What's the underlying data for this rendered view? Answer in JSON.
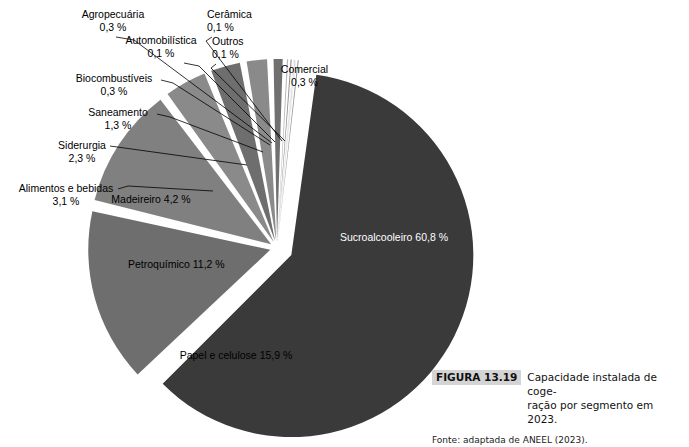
{
  "chart_data": {
    "type": "pie",
    "unit": "%",
    "legend_position": "callout-labels",
    "exploded": true,
    "categories": [
      "Sucroalcooleiro",
      "Papel e celulose",
      "Petroquímico",
      "Madeireiro",
      "Alimentos e bebidas",
      "Siderurgia",
      "Saneamento",
      "Biocombustíveis",
      "Agropecuária",
      "Automobilística",
      "Cerâmica",
      "Outros",
      "Comercial"
    ],
    "values": [
      60.8,
      15.9,
      11.2,
      4.2,
      3.1,
      2.3,
      1.3,
      0.3,
      0.3,
      0.1,
      0.1,
      0.1,
      0.3
    ],
    "value_labels": [
      "60,8 %",
      "15,9 %",
      "11,2 %",
      "4,2 %",
      "3,1 %",
      "2,3 %",
      "1,3 %",
      "0,3 %",
      "0,3 %",
      "0,1 %",
      "0,1 %",
      "0,1 %",
      "0,3 %"
    ],
    "slice_colors": [
      "#3a3a3a",
      "#6e6e6e",
      "#808080",
      "#8a8a8a",
      "#6e6e6e",
      "#8a8a8a",
      "#707070",
      "#b5b5b5",
      "#8f8f8f",
      "#cfcfcf",
      "#a8a8a8",
      "#d8d8d8",
      "#9a9a9a"
    ]
  },
  "slices": {
    "sucroalcooleiro": {
      "label": "Sucroalcooleiro",
      "value": "60,8 %"
    },
    "papel_e_celulose": {
      "label": "Papel e celulose",
      "value": "15,9 %"
    },
    "petroquimico": {
      "label": "Petroquímico",
      "value": "11,2 %"
    },
    "madeireiro": {
      "label": "Madeireiro",
      "value": "4,2 %"
    },
    "alimentos_e_bebidas": {
      "label": "Alimentos e bebidas",
      "value": "3,1 %"
    },
    "siderurgia": {
      "label": "Siderurgia",
      "value": "2,3 %"
    },
    "saneamento": {
      "label": "Saneamento",
      "value": "1,3 %"
    },
    "biocombustiveis": {
      "label": "Biocombustíveis",
      "value": "0,3 %"
    },
    "agropecuaria": {
      "label": "Agropecuária",
      "value": "0,3 %"
    },
    "automobilistica": {
      "label": "Automobilística",
      "value": "0,1 %"
    },
    "ceramica": {
      "label": "Cerâmica",
      "value": "0,1 %"
    },
    "outros": {
      "label": "Outros",
      "value": "0,1 %"
    },
    "comercial": {
      "label": "Comercial",
      "value": "0,3 %"
    }
  },
  "caption": {
    "figure_number": "FIGURA 13.19",
    "text_line1": "Capacidade instalada de coge-",
    "text_line2": "ração por segmento em 2023.",
    "source": "Fonte: adaptada de ANEEL (2023)."
  },
  "colors": {
    "dominant_slice": "#3a3a3a",
    "mid_gray": "#787878",
    "light_gray": "#c8c8c8",
    "badge_bg": "#d4d4d4",
    "text": "#000000",
    "label_on_dark": "#ffffff"
  }
}
